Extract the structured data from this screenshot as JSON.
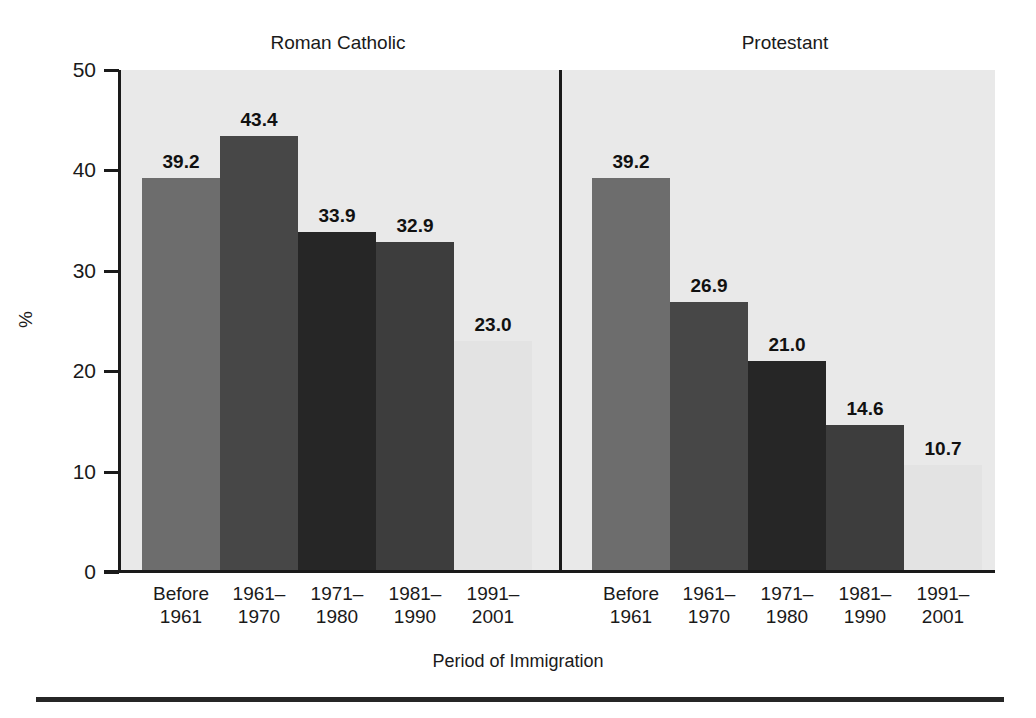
{
  "chart_data": {
    "type": "bar",
    "title": "",
    "xlabel": "Period of Immigration",
    "ylabel": "%",
    "ylim": [
      0,
      50
    ],
    "yticks": [
      "0",
      "10",
      "20",
      "30",
      "40",
      "50"
    ],
    "grid": false,
    "legend": null,
    "categories": [
      "Before\n1961",
      "1961–\n1970",
      "1971–\n1980",
      "1981–\n1990",
      "1991–\n2001"
    ],
    "panels": [
      {
        "name": "Roman Catholic",
        "values": [
          39.2,
          43.4,
          33.9,
          32.9,
          23.0
        ],
        "value_labels": [
          "39.2",
          "43.4",
          "33.9",
          "32.9",
          "23.0"
        ]
      },
      {
        "name": "Protestant",
        "values": [
          39.2,
          26.9,
          21.0,
          14.6,
          10.7
        ],
        "value_labels": [
          "39.2",
          "26.9",
          "21.0",
          "14.6",
          "10.7"
        ]
      }
    ],
    "series": [
      {
        "name": "Roman Catholic",
        "values": [
          39.2,
          43.4,
          33.9,
          32.9,
          23.0
        ]
      },
      {
        "name": "Protestant",
        "values": [
          39.2,
          26.9,
          21.0,
          14.6,
          10.7
        ]
      }
    ],
    "bar_colors": [
      "#6d6d6d",
      "#474747",
      "#262626",
      "#3d3d3d",
      "#e3e3e3"
    ],
    "plot_background": "#e9e9e9",
    "axis_color": "#1a1a1a"
  }
}
